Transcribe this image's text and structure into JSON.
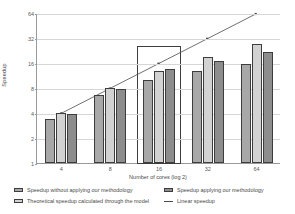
{
  "chart_data": {
    "type": "bar",
    "title": "",
    "xlabel": "Number of cores (log 2)",
    "ylabel": "Speedup",
    "categories": [
      "4",
      "8",
      "16",
      "32",
      "64"
    ],
    "ylim": [
      1,
      64
    ],
    "yscale": "log2",
    "yticks": [
      "1",
      "2",
      "4",
      "8",
      "16",
      "32",
      "64"
    ],
    "ytick_values": [
      1,
      2,
      4,
      8,
      16,
      32,
      64
    ],
    "grid": true,
    "legend_position": "bottom",
    "series": [
      {
        "name": "Speedup without applying our methodology",
        "type": "bar",
        "color": "#a8a8a8",
        "values": [
          3.4,
          6.6,
          10.0,
          13.0,
          15.5
        ]
      },
      {
        "name": "Theoretical speedup calculated through the model",
        "type": "bar",
        "color": "#d2d2d2",
        "values": [
          4.0,
          8.0,
          13.0,
          19.0,
          27.0
        ]
      },
      {
        "name": "Speedup applying our methodology",
        "type": "bar",
        "color": "#8d8d8d",
        "values": [
          3.9,
          7.8,
          13.5,
          17.0,
          22.0
        ]
      },
      {
        "name": "Linear speedup",
        "type": "line",
        "color": "#4a4a4a",
        "values": [
          4,
          8,
          16,
          32,
          64
        ]
      }
    ],
    "annotations": [
      {
        "name": "highlight-box",
        "category": "16",
        "description": "Rectangle highlighting the 16-core group"
      }
    ]
  },
  "legend": {
    "entries": [
      {
        "label": "Speedup without applying our methodology",
        "swatch": "s0"
      },
      {
        "label": "Speedup applying our methodology",
        "swatch": "s2"
      },
      {
        "label": "Theoretical  speedup  calculated through the model",
        "swatch": "s1"
      },
      {
        "label": "Linear speedup",
        "swatch": "line"
      }
    ]
  }
}
